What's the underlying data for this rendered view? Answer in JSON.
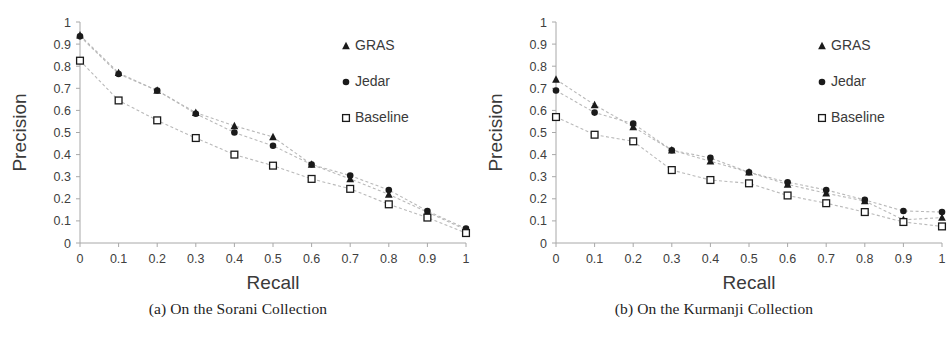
{
  "figure": {
    "panels": [
      {
        "id": "panel-a",
        "caption": "(a) On the Sorani Collection"
      },
      {
        "id": "panel-b",
        "caption": "(b) On the Kurmanji Collection"
      }
    ]
  },
  "chart_data": [
    {
      "type": "line",
      "title": "(a) On the Sorani Collection",
      "xlabel": "Recall",
      "ylabel": "Precision",
      "xlim": [
        0,
        1
      ],
      "ylim": [
        0,
        1
      ],
      "xticks": [
        "0",
        "0.1",
        "0.2",
        "0.3",
        "0.4",
        "0.5",
        "0.6",
        "0.7",
        "0.8",
        "0.9",
        "1"
      ],
      "yticks": [
        "0",
        "0.1",
        "0.2",
        "0.3",
        "0.4",
        "0.5",
        "0.6",
        "0.7",
        "0.8",
        "0.9",
        "1"
      ],
      "grid": false,
      "legend_position": "upper right",
      "x": [
        0,
        0.1,
        0.2,
        0.3,
        0.4,
        0.5,
        0.6,
        0.7,
        0.8,
        0.9,
        1
      ],
      "series": [
        {
          "name": "GRAS",
          "marker": "triangle",
          "values": [
            0.94,
            0.77,
            0.69,
            0.59,
            0.53,
            0.48,
            0.355,
            0.29,
            0.22,
            0.14,
            0.06
          ]
        },
        {
          "name": "Jedar",
          "marker": "circle",
          "values": [
            0.935,
            0.765,
            0.69,
            0.585,
            0.5,
            0.44,
            0.355,
            0.305,
            0.24,
            0.145,
            0.065
          ]
        },
        {
          "name": "Baseline",
          "marker": "square",
          "values": [
            0.825,
            0.645,
            0.555,
            0.475,
            0.4,
            0.35,
            0.29,
            0.245,
            0.175,
            0.115,
            0.045
          ]
        }
      ]
    },
    {
      "type": "line",
      "title": "(b) On the Kurmanji Collection",
      "xlabel": "Recall",
      "ylabel": "Precision",
      "xlim": [
        0,
        1
      ],
      "ylim": [
        0,
        1
      ],
      "xticks": [
        "0",
        "0.1",
        "0.2",
        "0.3",
        "0.4",
        "0.5",
        "0.6",
        "0.7",
        "0.8",
        "0.9",
        "1"
      ],
      "yticks": [
        "0",
        "0.1",
        "0.2",
        "0.3",
        "0.4",
        "0.5",
        "0.6",
        "0.7",
        "0.8",
        "0.9",
        "1"
      ],
      "grid": false,
      "legend_position": "upper right",
      "x": [
        0,
        0.1,
        0.2,
        0.3,
        0.4,
        0.5,
        0.6,
        0.7,
        0.8,
        0.9,
        1
      ],
      "series": [
        {
          "name": "GRAS",
          "marker": "triangle",
          "values": [
            0.74,
            0.625,
            0.525,
            0.42,
            0.37,
            0.32,
            0.265,
            0.225,
            0.19,
            0.105,
            0.115
          ]
        },
        {
          "name": "Jedar",
          "marker": "circle",
          "values": [
            0.69,
            0.59,
            0.54,
            0.42,
            0.385,
            0.32,
            0.275,
            0.24,
            0.195,
            0.145,
            0.14
          ]
        },
        {
          "name": "Baseline",
          "marker": "square",
          "values": [
            0.57,
            0.49,
            0.46,
            0.33,
            0.285,
            0.27,
            0.215,
            0.18,
            0.14,
            0.095,
            0.075
          ]
        }
      ]
    }
  ],
  "style": {
    "marker_color": "#1a1a1a",
    "line_color": "#b9b9b9",
    "axis_color": "#a8a8a8",
    "text_color": "#3a3a3a"
  }
}
